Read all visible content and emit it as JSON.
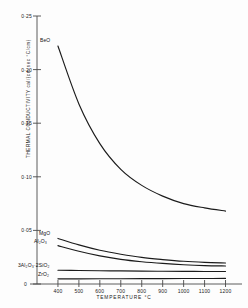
{
  "chart_data": {
    "type": "line",
    "title": "",
    "xlabel": "TEMPERATURE  °C",
    "ylabel_main": "THERMAL  CONDUCTIVITY",
    "ylabel_units": "cal/(cm sec °C/cm)",
    "xlim": [
      300,
      1250
    ],
    "ylim": [
      0,
      0.25
    ],
    "grid": false,
    "legend_position": "inline-labels",
    "xticks": [
      400,
      500,
      600,
      700,
      800,
      900,
      1000,
      1100,
      1200
    ],
    "xticklabels": [
      "400",
      "500",
      "600",
      "700",
      "800",
      "900",
      "1000",
      "1100",
      "1200"
    ],
    "yticks": [
      0,
      0.05,
      0.1,
      0.15,
      0.2,
      0.25
    ],
    "yticklabels": [
      "0",
      "0·05",
      "0·10",
      "0·15",
      "0·20",
      "0·25"
    ],
    "origin_label": "0",
    "x": [
      400,
      500,
      600,
      700,
      800,
      900,
      1000,
      1100,
      1200
    ],
    "series": [
      {
        "name": "BeO",
        "label": "BeO",
        "values": [
          0.222,
          0.168,
          0.131,
          0.107,
          0.092,
          0.082,
          0.075,
          0.071,
          0.068
        ]
      },
      {
        "name": "MgO",
        "label": "MgO",
        "values": [
          0.0425,
          0.0365,
          0.0315,
          0.0278,
          0.0248,
          0.0228,
          0.0212,
          0.0202,
          0.0196
        ]
      },
      {
        "name": "Al2O3",
        "label": "Al₂O₃",
        "values": [
          0.0358,
          0.0305,
          0.0262,
          0.023,
          0.0208,
          0.0192,
          0.018,
          0.0172,
          0.0168
        ]
      },
      {
        "name": "mullite",
        "label": "3Al₂O₃·2SiO₂",
        "values": [
          0.0128,
          0.0126,
          0.0124,
          0.0122,
          0.012,
          0.0119,
          0.0118,
          0.0117,
          0.0117
        ]
      },
      {
        "name": "ZrO2",
        "label": "ZrO₂",
        "values": [
          0.0048,
          0.0048,
          0.0049,
          0.0049,
          0.005,
          0.005,
          0.0051,
          0.0051,
          0.0052
        ]
      }
    ],
    "colors": {
      "curve": "#1b1b1b",
      "axis": "#4a4a4a",
      "background": "#fdfdfd"
    }
  },
  "axis": {
    "y_label_line": "THERMAL  CONDUCTIVITY  cal/(cm sec °C/cm)",
    "x_label_line": "TEMPERATURE  °C"
  }
}
